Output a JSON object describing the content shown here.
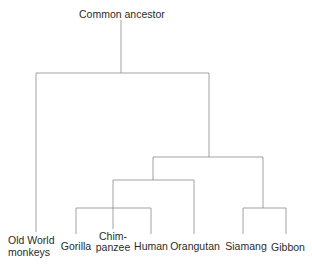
{
  "diagram": {
    "type": "phylogenetic-tree",
    "root_label": "Common ancestor",
    "line_color": "#8a8a8a",
    "leaves": [
      {
        "line1": "Old World",
        "line2": "monkeys"
      },
      {
        "line1": "",
        "line2": "Gorilla"
      },
      {
        "line1": "Chim-",
        "line2": "panzee"
      },
      {
        "line1": "",
        "line2": "Human"
      },
      {
        "line1": "",
        "line2": "Orangutan"
      },
      {
        "line1": "",
        "line2": "Siamang"
      },
      {
        "line1": "",
        "line2": "Gibbon"
      }
    ],
    "groupings": [
      "((Old World monkeys), (((Gorilla, Chimpanzee, Human), Orangutan), (Siamang, Gibbon)))"
    ]
  }
}
